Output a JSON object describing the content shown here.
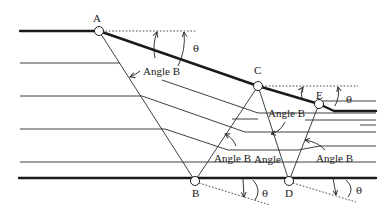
{
  "diagram": {
    "type": "geological cross-section / dip geometry",
    "colors": {
      "line": "#1a1a1a",
      "background": "#ffffff"
    },
    "points": [
      {
        "id": "A",
        "label": "A"
      },
      {
        "id": "B",
        "label": "B"
      },
      {
        "id": "C",
        "label": "C"
      },
      {
        "id": "D",
        "label": "D"
      },
      {
        "id": "E",
        "label": "E"
      }
    ],
    "angle_labels": {
      "angle_b_1": "Angle B",
      "angle_b_2": "Angle B",
      "angle_b_3": "Angle B",
      "angle_b_4": "Angle B",
      "angle_5": "Angle",
      "angle_b_6": "Angle B"
    },
    "theta_labels": {
      "theta_top_a": "θ",
      "theta_top_e": "θ",
      "theta_bottom_b": "θ",
      "theta_bottom_d": "θ"
    }
  }
}
